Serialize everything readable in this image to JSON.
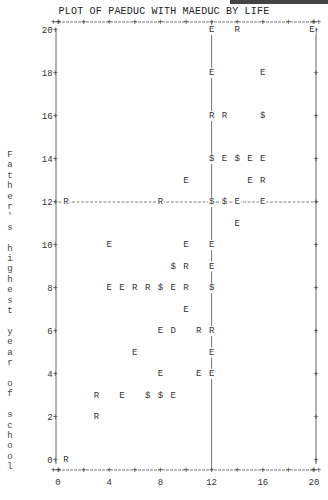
{
  "title": "PLOT OF PAEDUC WITH MAEDUC BY LIFE",
  "y_axis_label": "Father's highest year of school",
  "chart_data": {
    "type": "scatter",
    "title": "PLOT OF PAEDUC WITH MAEDUC BY LIFE",
    "xlabel": "",
    "ylabel": "Father's highest year of school",
    "x_ticks": [
      0,
      4,
      8,
      12,
      16,
      20
    ],
    "y_ticks": [
      0,
      2,
      4,
      6,
      8,
      10,
      12,
      14,
      16,
      18,
      20
    ],
    "xlim": [
      0,
      20
    ],
    "ylim": [
      0,
      20
    ],
    "grid": false,
    "reference_lines": {
      "x": 12,
      "y": 12
    },
    "symbol_legend_note": "Plot symbols are values of LIFE: E, R, D; $ = multiple occurrence",
    "points": [
      {
        "x": 12,
        "y": 20,
        "s": "E"
      },
      {
        "x": 14,
        "y": 20,
        "s": "R"
      },
      {
        "x": 20,
        "y": 20,
        "s": "E"
      },
      {
        "x": 12,
        "y": 18,
        "s": "E"
      },
      {
        "x": 16,
        "y": 18,
        "s": "E"
      },
      {
        "x": 12,
        "y": 16,
        "s": "R"
      },
      {
        "x": 13,
        "y": 16,
        "s": "R"
      },
      {
        "x": 16,
        "y": 16,
        "s": "$"
      },
      {
        "x": 12,
        "y": 14,
        "s": "$"
      },
      {
        "x": 13,
        "y": 14,
        "s": "E"
      },
      {
        "x": 14,
        "y": 14,
        "s": "$"
      },
      {
        "x": 15,
        "y": 14,
        "s": "E"
      },
      {
        "x": 16,
        "y": 14,
        "s": "E"
      },
      {
        "x": 10,
        "y": 13,
        "s": "E"
      },
      {
        "x": 15,
        "y": 13,
        "s": "E"
      },
      {
        "x": 16,
        "y": 13,
        "s": "R"
      },
      {
        "x": 0,
        "y": 12,
        "s": "R"
      },
      {
        "x": 8,
        "y": 12,
        "s": "R"
      },
      {
        "x": 12,
        "y": 12,
        "s": "$"
      },
      {
        "x": 13,
        "y": 12,
        "s": "$"
      },
      {
        "x": 14,
        "y": 12,
        "s": "E"
      },
      {
        "x": 16,
        "y": 12,
        "s": "E"
      },
      {
        "x": 14,
        "y": 11,
        "s": "E"
      },
      {
        "x": 4,
        "y": 10,
        "s": "E"
      },
      {
        "x": 10,
        "y": 10,
        "s": "E"
      },
      {
        "x": 12,
        "y": 10,
        "s": "E"
      },
      {
        "x": 9,
        "y": 9,
        "s": "$"
      },
      {
        "x": 10,
        "y": 9,
        "s": "R"
      },
      {
        "x": 12,
        "y": 9,
        "s": "E"
      },
      {
        "x": 4,
        "y": 8,
        "s": "E"
      },
      {
        "x": 5,
        "y": 8,
        "s": "E"
      },
      {
        "x": 6,
        "y": 8,
        "s": "R"
      },
      {
        "x": 7,
        "y": 8,
        "s": "R"
      },
      {
        "x": 8,
        "y": 8,
        "s": "$"
      },
      {
        "x": 9,
        "y": 8,
        "s": "E"
      },
      {
        "x": 10,
        "y": 8,
        "s": "R"
      },
      {
        "x": 12,
        "y": 8,
        "s": "$"
      },
      {
        "x": 10,
        "y": 7,
        "s": "E"
      },
      {
        "x": 8,
        "y": 6,
        "s": "E"
      },
      {
        "x": 9,
        "y": 6,
        "s": "D"
      },
      {
        "x": 11,
        "y": 6,
        "s": "R"
      },
      {
        "x": 12,
        "y": 6,
        "s": "R"
      },
      {
        "x": 6,
        "y": 5,
        "s": "E"
      },
      {
        "x": 12,
        "y": 5,
        "s": "E"
      },
      {
        "x": 8,
        "y": 4,
        "s": "E"
      },
      {
        "x": 11,
        "y": 4,
        "s": "E"
      },
      {
        "x": 12,
        "y": 4,
        "s": "E"
      },
      {
        "x": 3,
        "y": 3,
        "s": "R"
      },
      {
        "x": 5,
        "y": 3,
        "s": "E"
      },
      {
        "x": 7,
        "y": 3,
        "s": "$"
      },
      {
        "x": 8,
        "y": 3,
        "s": "$"
      },
      {
        "x": 9,
        "y": 3,
        "s": "E"
      },
      {
        "x": 3,
        "y": 2,
        "s": "R"
      },
      {
        "x": 0,
        "y": 0,
        "s": "R"
      }
    ]
  }
}
